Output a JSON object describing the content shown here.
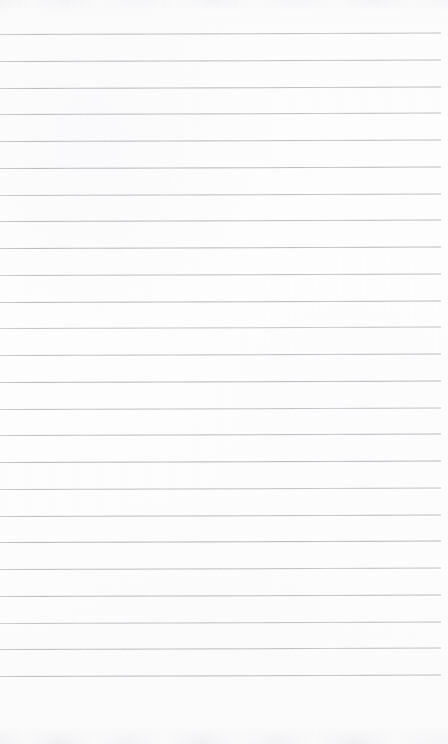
{
  "document": {
    "kind": "scanned-blank-ruled-notebook-page",
    "page_width": 448,
    "page_height": 744,
    "visible_text": "",
    "text_content_note": "No text, headings, labels, numbers or marks are present on this page.",
    "paper_color": "#fdfdfd",
    "rule_color": "#a9a9ae"
  },
  "ruling": {
    "line_count": 25,
    "first_line_y": 34,
    "last_line_y": 676,
    "line_spacing": 26.75,
    "line_thickness": 1,
    "line_start_x": 0,
    "line_end_x": 441,
    "right_margin_width": 7,
    "tilt_rise_px": -1.5,
    "lines_y": [
      34,
      60.75,
      87.5,
      114.25,
      141,
      167.75,
      194.5,
      221.25,
      248,
      274.75,
      301.5,
      328.25,
      355,
      381.75,
      408.5,
      435.25,
      462,
      488.75,
      515.5,
      542.25,
      569,
      595.75,
      622.5,
      649.25,
      676
    ]
  },
  "margins": {
    "top_blank_height": 34,
    "bottom_blank_height": 68,
    "left_margin_rule": "none",
    "vertical_margin_rule": "none"
  },
  "scan_artifacts": {
    "top_edge_band": "faint grey mottled band, y 0 to 11",
    "bottom_edge_band": "faint grey mottled band, y 728 to 744",
    "line_density_variation": "subtle lightening and darkening along each ruled line",
    "page_skew": "very slight upward tilt left to right"
  }
}
